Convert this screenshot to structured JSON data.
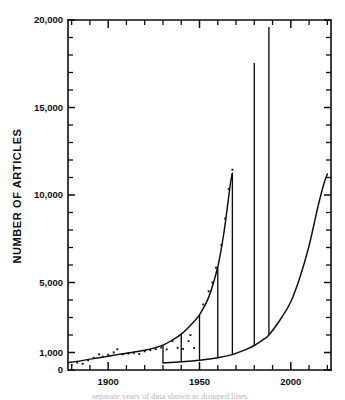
{
  "figure": {
    "background_color": "#ffffff",
    "ink_color": "#0d0d0d",
    "partial_caption": "separate years of data shown as dropped lines"
  },
  "chart_data": {
    "type": "line",
    "title": "",
    "subtitle": "",
    "xlabel": "",
    "ylabel": "NUMBER OF ARTICLES",
    "xlim": [
      1878,
      2022
    ],
    "ylim": [
      0,
      20000
    ],
    "grid": false,
    "legend": null,
    "x_ticks_major": [
      1900,
      1950,
      2000
    ],
    "x_tick_labels": [
      "1900",
      "1950",
      "2000"
    ],
    "x_ticks_minor_step": 10,
    "y_ticks_major": [
      0,
      1000,
      5000,
      10000,
      15000,
      20000
    ],
    "y_tick_labels": [
      "0",
      "1,000",
      "5,000",
      "10,000",
      "15,000",
      "20,000"
    ],
    "y_ticks_minor_step": 1000,
    "series": [
      {
        "name": "upper-growth-curve",
        "description": "Smooth exponential growth curve of annual article counts rising from the late 1870s to a peak near 1968",
        "x": [
          1878,
          1885,
          1890,
          1895,
          1900,
          1905,
          1910,
          1915,
          1920,
          1925,
          1930,
          1935,
          1940,
          1945,
          1950,
          1955,
          1960,
          1963,
          1965,
          1967,
          1968
        ],
        "values": [
          420,
          520,
          620,
          700,
          790,
          880,
          960,
          1040,
          1130,
          1250,
          1420,
          1700,
          2050,
          2550,
          3150,
          4150,
          5900,
          7600,
          9100,
          10700,
          11250
        ]
      },
      {
        "name": "lower-baseline-curve",
        "description": "Lower curve beginning near 1930 at the axis baseline and rising steeply to about 11,200 by 2020",
        "x": [
          1930,
          1940,
          1950,
          1960,
          1968,
          1975,
          1980,
          1985,
          1988,
          1995,
          2000,
          2005,
          2010,
          2015,
          2018,
          2020
        ],
        "values": [
          400,
          470,
          560,
          700,
          880,
          1150,
          1400,
          1750,
          2000,
          3000,
          3900,
          5300,
          7100,
          9400,
          10600,
          11200
        ]
      }
    ],
    "dropped_spikes": [
      {
        "year": 1930,
        "top": 1420,
        "bottom": 400
      },
      {
        "year": 1940,
        "top": 2050,
        "bottom": 470
      },
      {
        "year": 1950,
        "top": 3150,
        "bottom": 560
      },
      {
        "year": 1960,
        "top": 5900,
        "bottom": 700
      },
      {
        "year": 1968,
        "top": 11250,
        "bottom": 880
      },
      {
        "year": 1980,
        "top": 17550,
        "bottom": 1400
      },
      {
        "year": 1988,
        "top": 19600,
        "bottom": 2020
      }
    ],
    "scatter_points": [
      {
        "x": 1880,
        "y": 300
      },
      {
        "x": 1883,
        "y": 430
      },
      {
        "x": 1886,
        "y": 360
      },
      {
        "x": 1889,
        "y": 560
      },
      {
        "x": 1892,
        "y": 700
      },
      {
        "x": 1895,
        "y": 900
      },
      {
        "x": 1897,
        "y": 760
      },
      {
        "x": 1900,
        "y": 880
      },
      {
        "x": 1903,
        "y": 1010
      },
      {
        "x": 1905,
        "y": 1190
      },
      {
        "x": 1908,
        "y": 900
      },
      {
        "x": 1911,
        "y": 940
      },
      {
        "x": 1914,
        "y": 980
      },
      {
        "x": 1917,
        "y": 920
      },
      {
        "x": 1920,
        "y": 1070
      },
      {
        "x": 1923,
        "y": 1140
      },
      {
        "x": 1926,
        "y": 1190
      },
      {
        "x": 1929,
        "y": 1290
      },
      {
        "x": 1932,
        "y": 1180
      },
      {
        "x": 1935,
        "y": 1660
      },
      {
        "x": 1938,
        "y": 1270
      },
      {
        "x": 1941,
        "y": 1210
      },
      {
        "x": 1944,
        "y": 1650
      },
      {
        "x": 1945,
        "y": 2000
      },
      {
        "x": 1947,
        "y": 1260
      },
      {
        "x": 1952,
        "y": 3750
      },
      {
        "x": 1955,
        "y": 4500
      },
      {
        "x": 1957,
        "y": 5000
      },
      {
        "x": 1959,
        "y": 5850
      },
      {
        "x": 1962,
        "y": 7150
      },
      {
        "x": 1964,
        "y": 8650
      },
      {
        "x": 1966,
        "y": 10350
      },
      {
        "x": 1968,
        "y": 11450
      }
    ]
  }
}
